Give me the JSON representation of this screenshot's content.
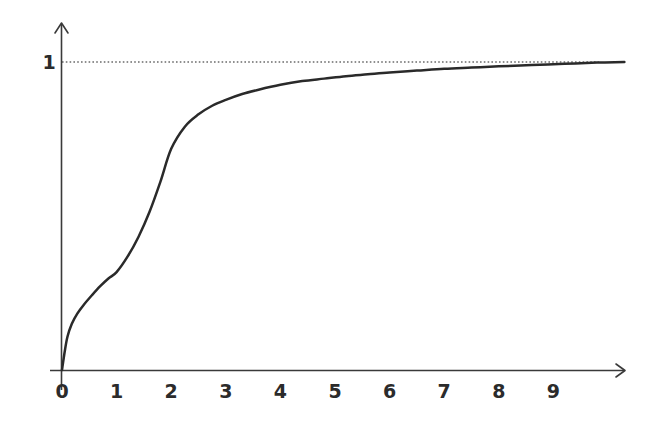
{
  "chart_data": {
    "type": "line",
    "title": "",
    "subtitle": "",
    "xlabel": "",
    "ylabel": "",
    "xlim": [
      0,
      10.3
    ],
    "ylim": [
      0,
      1.06
    ],
    "grid": false,
    "legend": null,
    "x_tick_labels": [
      "0",
      "1",
      "2",
      "3",
      "4",
      "5",
      "6",
      "7",
      "8",
      "9"
    ],
    "x_tick_values": [
      0,
      1,
      2,
      3,
      4,
      5,
      6,
      7,
      8,
      9
    ],
    "y_tick_labels": [
      "1"
    ],
    "y_tick_values": [
      1
    ],
    "annotations": [
      {
        "name": "asymptote-line",
        "kind": "horizontal-dashed-reference-line",
        "y": 1,
        "label": "1",
        "color": "#6b6b6b"
      }
    ],
    "series": [
      {
        "name": "saturating-curve",
        "color": "#2a2a2a",
        "x": [
          0.0,
          0.05,
          0.1,
          0.18,
          0.28,
          0.4,
          0.55,
          0.7,
          0.85,
          1.0,
          1.2,
          1.4,
          1.6,
          1.8,
          2.0,
          2.25,
          2.5,
          2.75,
          3.0,
          3.3,
          3.6,
          4.0,
          4.4,
          4.8,
          5.2,
          5.6,
          6.0,
          6.5,
          7.0,
          7.5,
          8.0,
          8.6,
          9.2,
          9.8,
          10.3
        ],
        "y": [
          0.0,
          0.06,
          0.108,
          0.15,
          0.183,
          0.212,
          0.243,
          0.272,
          0.297,
          0.318,
          0.368,
          0.432,
          0.512,
          0.61,
          0.718,
          0.79,
          0.83,
          0.858,
          0.877,
          0.896,
          0.91,
          0.926,
          0.938,
          0.946,
          0.954,
          0.96,
          0.966,
          0.972,
          0.978,
          0.982,
          0.986,
          0.99,
          0.994,
          0.998,
          1.0
        ]
      }
    ]
  },
  "axes": {
    "x_axis_name": "x-axis",
    "y_axis_name": "y-axis",
    "x_arrow": "arrow-right",
    "y_arrow": "arrow-up"
  },
  "colors": {
    "curve": "#2a2a2a",
    "axis": "#3a3a3a",
    "dashed": "#6b6b6b",
    "text": "#2b2b2b",
    "background": "#ffffff"
  }
}
